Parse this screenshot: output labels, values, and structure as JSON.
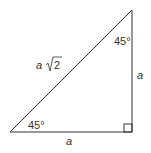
{
  "diagram": {
    "type": "45-45-90 right triangle",
    "hypotenuse_label": "a",
    "hypotenuse_radical": "2",
    "vertical_leg_label": "a",
    "horizontal_leg_label": "a",
    "top_angle_label": "45°",
    "bottom_left_angle_label": "45°",
    "line_color": "#333333"
  }
}
